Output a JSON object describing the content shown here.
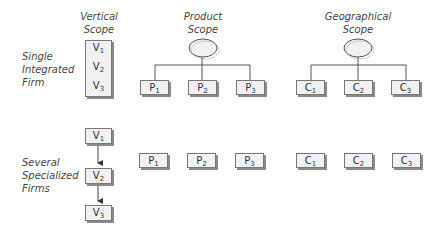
{
  "headers": {
    "vertical": [
      "Vertical",
      "Scope"
    ],
    "product": [
      "Product",
      "Scope"
    ],
    "geographical": [
      "Geographical",
      "Scope"
    ]
  },
  "rows": {
    "single": [
      "Single",
      "Integrated",
      "Firm"
    ],
    "several": [
      "Several",
      "Specialized",
      "Firms"
    ]
  },
  "vertical_items": [
    {
      "letter": "V",
      "sub": "1"
    },
    {
      "letter": "V",
      "sub": "2"
    },
    {
      "letter": "V",
      "sub": "3"
    }
  ],
  "product_items": [
    {
      "letter": "P",
      "sub": "1"
    },
    {
      "letter": "P",
      "sub": "2"
    },
    {
      "letter": "P",
      "sub": "3"
    }
  ],
  "geo_items": [
    {
      "letter": "C",
      "sub": "1"
    },
    {
      "letter": "C",
      "sub": "2"
    },
    {
      "letter": "C",
      "sub": "3"
    }
  ]
}
